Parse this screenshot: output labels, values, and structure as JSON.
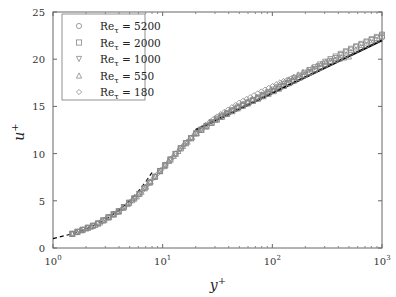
{
  "chart_data": {
    "type": "scatter",
    "title": "",
    "xlabel": "y+",
    "ylabel": "u+",
    "xscale": "log",
    "xlim": [
      1,
      1000
    ],
    "ylim": [
      0,
      25
    ],
    "x_ticks": [
      "10^0",
      "10^1",
      "10^2",
      "10^3"
    ],
    "y_ticks": [
      0,
      5,
      10,
      15,
      20,
      25
    ],
    "grid": false,
    "legend_position": "upper left",
    "legend": [
      "Re_τ = 5200",
      "Re_τ = 2000",
      "Re_τ = 1000",
      "Re_τ = 550",
      "Re_τ = 180"
    ],
    "series": [
      {
        "name": "Re_τ = 5200",
        "marker": "circle",
        "x": [
          1.5,
          2.5,
          4,
          6,
          8,
          11,
          15,
          20,
          30,
          50,
          80,
          120,
          200,
          300,
          500,
          700,
          1000
        ],
        "y": [
          1.5,
          2.5,
          3.9,
          5.6,
          7.2,
          9.0,
          10.7,
          12.1,
          13.5,
          14.9,
          16.0,
          17.0,
          18.3,
          19.3,
          20.6,
          21.4,
          22.3
        ]
      },
      {
        "name": "Re_τ = 2000",
        "marker": "square",
        "x": [
          1.5,
          2.5,
          4,
          6,
          8,
          11,
          15,
          20,
          30,
          50,
          80,
          120,
          200,
          300,
          500,
          700,
          1000
        ],
        "y": [
          1.5,
          2.5,
          3.9,
          5.6,
          7.2,
          9.0,
          10.7,
          12.1,
          13.5,
          14.9,
          16.0,
          17.0,
          18.4,
          19.5,
          20.9,
          21.7,
          22.5
        ]
      },
      {
        "name": "Re_τ = 1000",
        "marker": "triangle-down",
        "x": [
          1.5,
          2.5,
          4,
          6,
          8,
          11,
          15,
          20,
          30,
          50,
          80,
          120,
          200,
          300,
          500,
          700,
          1000
        ],
        "y": [
          1.5,
          2.5,
          3.9,
          5.6,
          7.2,
          9.0,
          10.7,
          12.1,
          13.6,
          15.0,
          16.1,
          17.2,
          18.6,
          19.7,
          21.0,
          21.8,
          22.6
        ]
      },
      {
        "name": "Re_τ = 550",
        "marker": "triangle-up",
        "x": [
          1.5,
          2.5,
          4,
          6,
          8,
          11,
          15,
          20,
          30,
          50,
          80,
          120,
          200,
          300,
          500
        ],
        "y": [
          1.5,
          2.5,
          3.9,
          5.6,
          7.2,
          9.0,
          10.7,
          12.1,
          13.6,
          15.1,
          16.3,
          17.4,
          18.8,
          19.7,
          20.3
        ]
      },
      {
        "name": "Re_τ = 180",
        "marker": "diamond",
        "x": [
          1.5,
          2.5,
          4,
          6,
          8,
          11,
          15,
          20,
          30,
          50,
          80,
          120,
          160
        ],
        "y": [
          1.5,
          2.5,
          3.9,
          5.6,
          7.2,
          9.0,
          10.7,
          12.2,
          13.8,
          15.4,
          16.6,
          17.6,
          18.1
        ]
      }
    ],
    "reference_lines": [
      {
        "name": "viscous sublayer u+ = y+",
        "style": "dashed",
        "x": [
          1,
          1.5,
          2,
          3,
          4,
          5,
          6,
          7,
          8
        ],
        "y": [
          1,
          1.5,
          2,
          3,
          4,
          5,
          6,
          7,
          8
        ]
      },
      {
        "name": "log law u+ = (1/0.41) ln y+ + 5.2",
        "style": "solid",
        "x": [
          20,
          1000
        ],
        "y": [
          12.5,
          22.0
        ]
      }
    ]
  }
}
